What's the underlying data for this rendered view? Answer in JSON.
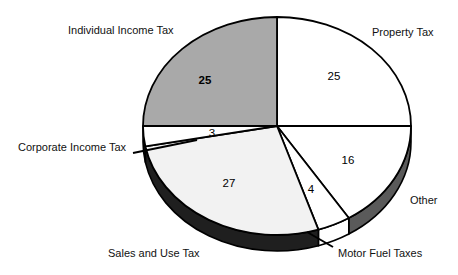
{
  "chart_data": {
    "type": "pie",
    "title": "",
    "subtitle": "",
    "xlabel": "",
    "ylabel": "",
    "legend_position": "callout-labels",
    "grid": false,
    "units": "percent",
    "total": 100,
    "categories": [
      "Property Tax",
      "Other",
      "Motor Fuel Taxes",
      "Sales and Use Tax",
      "Corporate Income Tax",
      "Individual Income Tax"
    ],
    "values": [
      25,
      16,
      4,
      27,
      3,
      25
    ],
    "slices": [
      {
        "label": "Property Tax",
        "value": 25,
        "value_text": "25",
        "top_color": "#ffffff",
        "side_color": "#1a1a1a",
        "start_deg": 0,
        "end_deg": 90,
        "label_x": 372,
        "label_y": 32,
        "val_x": 334,
        "val_y": 77,
        "bold": false
      },
      {
        "label": "Other",
        "value": 16,
        "value_text": "16",
        "top_color": "#ffffff",
        "side_color": "#5a5a5a",
        "start_deg": 90,
        "end_deg": 147.6,
        "label_x": 410,
        "label_y": 200,
        "val_x": 348,
        "val_y": 161,
        "bold": false
      },
      {
        "label": "Motor Fuel Taxes",
        "value": 4,
        "value_text": "4",
        "top_color": "#ffffff",
        "side_color": "#ffffff",
        "start_deg": 147.6,
        "end_deg": 162.0,
        "label_x": 338,
        "label_y": 253,
        "val_x": 311,
        "val_y": 190,
        "bold": false
      },
      {
        "label": "Sales and Use Tax",
        "value": 27,
        "value_text": "27",
        "top_color": "#f2f2f2",
        "side_color": "#1f1f1f",
        "start_deg": 162.0,
        "end_deg": 259.2,
        "label_x": 108,
        "label_y": 253,
        "val_x": 229,
        "val_y": 184,
        "bold": false
      },
      {
        "label": "Corporate Income Tax",
        "value": 3,
        "value_text": "3",
        "top_color": "#ffffff",
        "side_color": "#1f1f1f",
        "start_deg": 259.2,
        "end_deg": 270,
        "label_x": 18,
        "label_y": 147,
        "val_x": 212,
        "val_y": 134,
        "bold": false
      },
      {
        "label": "Individual Income Tax",
        "value": 25,
        "value_text": "25",
        "top_color": "#a9a9a9",
        "side_color": "#a9a9a9",
        "start_deg": 270,
        "end_deg": 360,
        "label_x": 68,
        "label_y": 30,
        "val_x": 205,
        "val_y": 81,
        "bold": true
      }
    ],
    "geometry": {
      "cx": 277,
      "cy": 126,
      "rx": 134,
      "ry": 109,
      "depth": 16
    },
    "leader_lines": [
      {
        "name": "corporate-income-tax-leader",
        "x1": 133,
        "y1": 153,
        "x2": 197,
        "y2": 140
      },
      {
        "name": "motor-fuel-taxes-leader",
        "x1": 333,
        "y1": 247,
        "x2": 307,
        "y2": 232
      }
    ]
  },
  "colors": {
    "outline": "#000000",
    "background": "#ffffff",
    "individual_income_tax": "#a9a9a9",
    "sales_and_use_tax_rim": "#1f1f1f",
    "other_rim": "#5a5a5a",
    "text": "#111111"
  }
}
